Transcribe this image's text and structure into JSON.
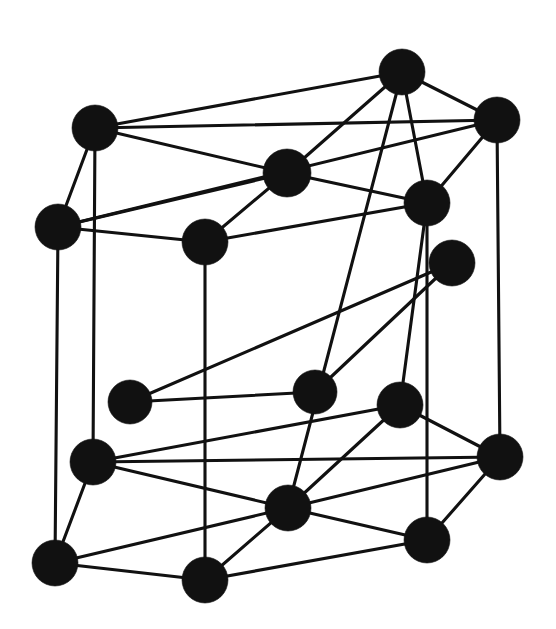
{
  "figure": {
    "caption": "",
    "background_color": "#ffffff",
    "atom_color": "#111111",
    "bond_color": "#111111",
    "atom_radius": 22,
    "bond_width": 3.1,
    "width": 556,
    "height": 629
  },
  "chart_data": {
    "type": "scatter",
    "xlabel": "",
    "ylabel": "",
    "xlim": [
      0,
      556
    ],
    "ylim": [
      0,
      629
    ],
    "grid": false,
    "legend": "none",
    "atoms": [
      {
        "id": "a1",
        "name": "top-back-left",
        "layer": "top",
        "x": 95,
        "y": 128,
        "r": 23
      },
      {
        "id": "a2",
        "name": "top-back-right",
        "layer": "top",
        "x": 402,
        "y": 72,
        "r": 23
      },
      {
        "id": "a3",
        "name": "top-right-rear",
        "layer": "top",
        "x": 497,
        "y": 120,
        "r": 23
      },
      {
        "id": "a4",
        "name": "top-front-left",
        "layer": "top",
        "x": 58,
        "y": 227,
        "r": 23
      },
      {
        "id": "a5",
        "name": "top-center",
        "layer": "top",
        "x": 287,
        "y": 173,
        "r": 24
      },
      {
        "id": "a6",
        "name": "top-right-front",
        "layer": "top",
        "x": 427,
        "y": 203,
        "r": 23
      },
      {
        "id": "a7",
        "name": "top-front-center",
        "layer": "top",
        "x": 205,
        "y": 242,
        "r": 23
      },
      {
        "id": "b1",
        "name": "mid-right",
        "layer": "middle",
        "x": 452,
        "y": 263,
        "r": 23
      },
      {
        "id": "b2",
        "name": "mid-left",
        "layer": "middle",
        "x": 130,
        "y": 402,
        "r": 22
      },
      {
        "id": "b3",
        "name": "mid-center",
        "layer": "middle",
        "x": 315,
        "y": 392,
        "r": 22
      },
      {
        "id": "b4",
        "name": "mid-right-front",
        "layer": "middle",
        "x": 400,
        "y": 405,
        "r": 23
      },
      {
        "id": "c1",
        "name": "bottom-back-left",
        "layer": "bottom",
        "x": 93,
        "y": 462,
        "r": 23
      },
      {
        "id": "c2",
        "name": "bottom-right-rear",
        "layer": "bottom",
        "x": 500,
        "y": 457,
        "r": 23
      },
      {
        "id": "c3",
        "name": "bottom-front-left",
        "layer": "bottom",
        "x": 55,
        "y": 563,
        "r": 23
      },
      {
        "id": "c4",
        "name": "bottom-center",
        "layer": "bottom",
        "x": 288,
        "y": 508,
        "r": 23
      },
      {
        "id": "c5",
        "name": "bottom-right-front",
        "layer": "bottom",
        "x": 427,
        "y": 540,
        "r": 23
      },
      {
        "id": "c6",
        "name": "bottom-front-center",
        "layer": "bottom",
        "x": 205,
        "y": 580,
        "r": 23
      }
    ],
    "bonds": [
      [
        "a1",
        "a2"
      ],
      [
        "a1",
        "a5"
      ],
      [
        "a1",
        "a3"
      ],
      [
        "a1",
        "a4"
      ],
      [
        "a2",
        "a3"
      ],
      [
        "a2",
        "a5"
      ],
      [
        "a2",
        "a6"
      ],
      [
        "a3",
        "a6"
      ],
      [
        "a3",
        "a4"
      ],
      [
        "a4",
        "a5"
      ],
      [
        "a4",
        "a7"
      ],
      [
        "a5",
        "a6"
      ],
      [
        "a5",
        "a7"
      ],
      [
        "a6",
        "a7"
      ],
      [
        "a1",
        "c1"
      ],
      [
        "a4",
        "c3"
      ],
      [
        "a2",
        "c4"
      ],
      [
        "a3",
        "c2"
      ],
      [
        "a6",
        "c5"
      ],
      [
        "a7",
        "c6"
      ],
      [
        "b1",
        "b2"
      ],
      [
        "b1",
        "b3"
      ],
      [
        "b2",
        "b3"
      ],
      [
        "c1",
        "c2"
      ],
      [
        "c1",
        "c4"
      ],
      [
        "c1",
        "c3"
      ],
      [
        "c2",
        "c4"
      ],
      [
        "c2",
        "c5"
      ],
      [
        "c3",
        "c4"
      ],
      [
        "c3",
        "c6"
      ],
      [
        "c4",
        "c5"
      ],
      [
        "c4",
        "c6"
      ],
      [
        "c5",
        "c6"
      ],
      [
        "b4",
        "c2"
      ],
      [
        "b4",
        "c4"
      ],
      [
        "b4",
        "c1"
      ],
      [
        "b4",
        "a6"
      ]
    ]
  }
}
